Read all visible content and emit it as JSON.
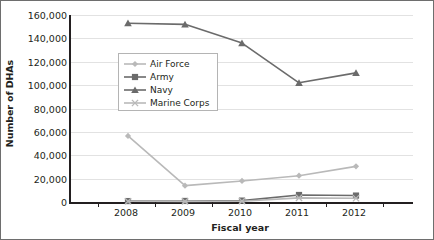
{
  "chart_data": {
    "type": "line",
    "title": "",
    "xlabel": "Fiscal year",
    "ylabel": "Number of DHAs",
    "categories": [
      "2008",
      "2009",
      "2010",
      "2011",
      "2012"
    ],
    "x": [
      2008,
      2009,
      2010,
      2011,
      2012
    ],
    "ylim": [
      0,
      160000
    ],
    "xlim": [
      2007.5,
      2012.5
    ],
    "y_ticks": [
      0,
      20000,
      40000,
      60000,
      80000,
      100000,
      120000,
      140000,
      160000
    ],
    "y_tick_labels": [
      "0",
      "20,000",
      "40,000",
      "60,000",
      "80,000",
      "100,000",
      "120,000",
      "140,000",
      "160,000"
    ],
    "x_tick_labels": [
      "2008",
      "2009",
      "2010",
      "2011",
      "2012"
    ],
    "grid": true,
    "legend_position": "upper-left-inside",
    "series": [
      {
        "name": "Air Force",
        "values": [
          56500,
          14000,
          18000,
          22500,
          30500
        ],
        "color": "#b9b9b9",
        "marker": "diamond"
      },
      {
        "name": "Army",
        "values": [
          800,
          900,
          1200,
          6000,
          5500
        ],
        "color": "#6b6b6b",
        "marker": "square"
      },
      {
        "name": "Navy",
        "values": [
          153000,
          152000,
          136000,
          102000,
          110500
        ],
        "color": "#6b6b6b",
        "marker": "triangle"
      },
      {
        "name": "Marine Corps",
        "values": [
          600,
          500,
          700,
          3500,
          3200
        ],
        "color": "#b9b9b9",
        "marker": "x"
      }
    ]
  },
  "axis": {
    "y_title": "Number of DHAs",
    "x_title": "Fiscal year"
  },
  "legend": {
    "items": [
      {
        "label": "Air Force"
      },
      {
        "label": "Army"
      },
      {
        "label": "Navy"
      },
      {
        "label": "Marine Corps"
      }
    ]
  },
  "colors": {
    "axis": "#231f20",
    "grid": "#e2e2e2",
    "light_series": "#b9b9b9",
    "dark_series": "#6b6b6b",
    "border": "#6e6e6e",
    "background": "#ffffff"
  }
}
